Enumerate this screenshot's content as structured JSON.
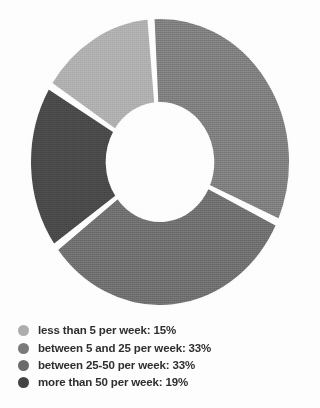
{
  "chart_data": {
    "type": "pie",
    "variant": "donut",
    "title": "",
    "subtitle": "",
    "xlabel": "",
    "ylabel": "",
    "grid": false,
    "legend_position": "bottom-left",
    "hole_ratio": 0.41,
    "start_angle_deg": -58,
    "direction": "clockwise",
    "separator_color": "#ffffff",
    "background_color": "#fdfdfd",
    "categories": [
      "less than 5 per week",
      "between 5 and 25 per week",
      "between 25-50 per week",
      "more than 50 per week"
    ],
    "values": [
      15,
      33,
      33,
      19
    ],
    "units": "%",
    "colors": [
      "#adadad",
      "#7a7a7a",
      "#6b6b6b",
      "#434343"
    ],
    "slices": [
      {
        "label": "less than 5 per week",
        "value": 15,
        "color": "#adadad",
        "start_angle_deg": -58,
        "end_angle_deg": -4
      },
      {
        "label": "between 5 and 25 per week",
        "value": 33,
        "color": "#7a7a7a",
        "start_angle_deg": -4,
        "end_angle_deg": 114.8
      },
      {
        "label": "between 25-50 per week",
        "value": 33,
        "color": "#6b6b6b",
        "start_angle_deg": 114.8,
        "end_angle_deg": 233.6
      },
      {
        "label": "more than 50 per week",
        "value": 19,
        "color": "#434343",
        "start_angle_deg": 233.6,
        "end_angle_deg": 302
      }
    ]
  },
  "legend": {
    "items": [
      {
        "marker": "legend-swatch-light-gray",
        "color": "#adadad",
        "text": "less than 5 per week: 15%"
      },
      {
        "marker": "legend-swatch-medium-gray",
        "color": "#7a7a7a",
        "text": "between 5 and 25 per week: 33%"
      },
      {
        "marker": "legend-swatch-medium-dark-gray",
        "color": "#6b6b6b",
        "text": "between 25-50 per week: 33%"
      },
      {
        "marker": "legend-swatch-dark-gray",
        "color": "#434343",
        "text": "more than 50 per week: 19%"
      }
    ]
  }
}
